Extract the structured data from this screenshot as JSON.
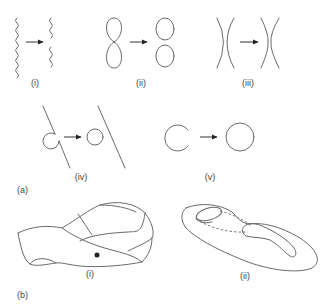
{
  "figure": {
    "panel_a": {
      "label": "(a)",
      "subfigures": [
        {
          "id": "i",
          "label": "(i)",
          "description": "wavy line splits into two wavy segments"
        },
        {
          "id": "ii",
          "label": "(ii)",
          "description": "pinched loop splits into two circles"
        },
        {
          "id": "iii",
          "label": "(iii)",
          "description": "two facing arcs join at a neck"
        },
        {
          "id": "iv",
          "label": "(iv)",
          "description": "arc attached to line detaches into a circle"
        },
        {
          "id": "v",
          "label": "(v)",
          "description": "open circle closes into a full circle"
        }
      ]
    },
    "panel_b": {
      "label": "(b)",
      "subfigures": [
        {
          "id": "i",
          "label": "(i)",
          "description": "Möbius-like twisted band with marked point"
        },
        {
          "id": "ii",
          "label": "(ii)",
          "description": "surface with handle and dashed path to a hole"
        }
      ]
    },
    "colors": {
      "stroke": "#6a6a6a",
      "arrow": "#222222",
      "text": "#444444",
      "background": "#ffffff"
    }
  }
}
